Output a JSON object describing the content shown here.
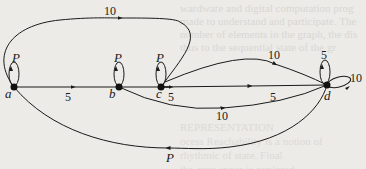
{
  "diagram": {
    "type": "state-transition-graph",
    "nodes": [
      {
        "id": "a",
        "label": "a"
      },
      {
        "id": "b",
        "label": "b"
      },
      {
        "id": "c",
        "label": "c"
      },
      {
        "id": "d",
        "label": "d"
      }
    ],
    "edges": [
      {
        "from": "a",
        "to": "a",
        "label": "P"
      },
      {
        "from": "b",
        "to": "b",
        "label": "P"
      },
      {
        "from": "c",
        "to": "c",
        "label": "P"
      },
      {
        "from": "d",
        "to": "d",
        "label": "5"
      },
      {
        "from": "d",
        "to": "d",
        "label": "10"
      },
      {
        "from": "a",
        "to": "b",
        "label": "5"
      },
      {
        "from": "b",
        "to": "c",
        "label": "5"
      },
      {
        "from": "c",
        "to": "d",
        "label": "5"
      },
      {
        "from": "c",
        "to": "d",
        "label": "10",
        "curve": "above"
      },
      {
        "from": "b",
        "to": "d",
        "label": "10",
        "curve": "below"
      },
      {
        "from": "a",
        "to": "c",
        "label": "10",
        "curve": "over-top"
      },
      {
        "from": "d",
        "to": "a",
        "label": "P",
        "curve": "under-bottom"
      }
    ]
  },
  "background": {
    "bleed_text_top": [
      "wardware and digital computation prog",
      "made to understand and participate. The",
      "number of elements in the graph, the dis",
      "thus to the sequential state of the gr"
    ],
    "bleed_text_bottom": [
      "REPRESENTATION",
      "ocess Reachability is a notion of",
      "rhythmic of state. Final",
      "the state space is explored"
    ]
  }
}
